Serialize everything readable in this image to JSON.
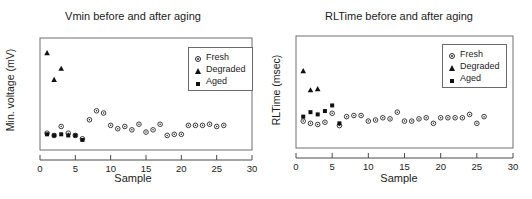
{
  "figure": {
    "panels": [
      {
        "id": "vmin-panel",
        "title": "Vmin before and after aging",
        "ylabel": "Min. voltage (mV)",
        "xlabel": "Sample",
        "legend": {
          "items": [
            {
              "label": "Fresh",
              "marker": "open-circle"
            },
            {
              "label": "Degraded",
              "marker": "filled-triangle"
            },
            {
              "label": "Aged",
              "marker": "filled-square"
            }
          ]
        },
        "xticks": [
          "0",
          "5",
          "10",
          "15",
          "20",
          "25",
          "30"
        ]
      },
      {
        "id": "rltime-panel",
        "title": "RLTime before and after aging",
        "ylabel": "RLTime (msec)",
        "xlabel": "Sample",
        "legend": {
          "items": [
            {
              "label": "Fresh",
              "marker": "open-circle"
            },
            {
              "label": "Degraded",
              "marker": "filled-triangle"
            },
            {
              "label": "Aged",
              "marker": "filled-square"
            }
          ]
        },
        "xticks": [
          "0",
          "5",
          "10",
          "15",
          "20",
          "25",
          "30"
        ]
      }
    ]
  },
  "chart_data": [
    {
      "type": "scatter",
      "title": "Vmin before and after aging",
      "xlabel": "Sample",
      "ylabel": "Min. voltage (mV)",
      "xlim": [
        0,
        30
      ],
      "ylim": [
        0,
        100
      ],
      "xticks": [
        0,
        5,
        10,
        15,
        20,
        25,
        30
      ],
      "yticks": [],
      "grid": false,
      "legend_position": "top-right",
      "series": [
        {
          "name": "Fresh",
          "marker": "open-circle",
          "points": [
            {
              "x": 1,
              "y": 15
            },
            {
              "x": 2,
              "y": 13
            },
            {
              "x": 3,
              "y": 21
            },
            {
              "x": 4,
              "y": 15
            },
            {
              "x": 5,
              "y": 13
            },
            {
              "x": 6,
              "y": 10
            },
            {
              "x": 7,
              "y": 27
            },
            {
              "x": 8,
              "y": 35
            },
            {
              "x": 9,
              "y": 33
            },
            {
              "x": 10,
              "y": 22
            },
            {
              "x": 11,
              "y": 19
            },
            {
              "x": 12,
              "y": 21
            },
            {
              "x": 13,
              "y": 18
            },
            {
              "x": 14,
              "y": 23
            },
            {
              "x": 15,
              "y": 16
            },
            {
              "x": 16,
              "y": 18
            },
            {
              "x": 17,
              "y": 23
            },
            {
              "x": 18,
              "y": 13
            },
            {
              "x": 19,
              "y": 14
            },
            {
              "x": 20,
              "y": 14
            },
            {
              "x": 21,
              "y": 22
            },
            {
              "x": 22,
              "y": 22
            },
            {
              "x": 23,
              "y": 22
            },
            {
              "x": 24,
              "y": 23
            },
            {
              "x": 25,
              "y": 21
            },
            {
              "x": 26,
              "y": 22
            }
          ]
        },
        {
          "name": "Degraded",
          "marker": "filled-triangle",
          "points": [
            {
              "x": 1,
              "y": 87
            },
            {
              "x": 2,
              "y": 63
            },
            {
              "x": 3,
              "y": 73
            }
          ]
        },
        {
          "name": "Aged",
          "marker": "filled-square",
          "points": [
            {
              "x": 1,
              "y": 14
            },
            {
              "x": 2,
              "y": 13
            },
            {
              "x": 3,
              "y": 14
            },
            {
              "x": 4,
              "y": 13
            },
            {
              "x": 5,
              "y": 13
            },
            {
              "x": 6,
              "y": 9
            }
          ]
        }
      ]
    },
    {
      "type": "scatter",
      "title": "RLTime before and after aging",
      "xlabel": "Sample",
      "ylabel": "RLTime (msec)",
      "xlim": [
        0,
        30
      ],
      "ylim": [
        0,
        100
      ],
      "xticks": [
        0,
        5,
        10,
        15,
        20,
        25,
        30
      ],
      "yticks": [],
      "grid": false,
      "legend_position": "top-right",
      "series": [
        {
          "name": "Fresh",
          "marker": "open-circle",
          "points": [
            {
              "x": 1,
              "y": 24
            },
            {
              "x": 2,
              "y": 22
            },
            {
              "x": 3,
              "y": 21
            },
            {
              "x": 4,
              "y": 23
            },
            {
              "x": 5,
              "y": 31
            },
            {
              "x": 6,
              "y": 20
            },
            {
              "x": 7,
              "y": 28
            },
            {
              "x": 8,
              "y": 29
            },
            {
              "x": 9,
              "y": 29
            },
            {
              "x": 10,
              "y": 24
            },
            {
              "x": 11,
              "y": 25
            },
            {
              "x": 12,
              "y": 27
            },
            {
              "x": 13,
              "y": 26
            },
            {
              "x": 14,
              "y": 32
            },
            {
              "x": 15,
              "y": 24
            },
            {
              "x": 16,
              "y": 24
            },
            {
              "x": 17,
              "y": 26
            },
            {
              "x": 18,
              "y": 27
            },
            {
              "x": 19,
              "y": 22
            },
            {
              "x": 20,
              "y": 27
            },
            {
              "x": 21,
              "y": 27
            },
            {
              "x": 22,
              "y": 27
            },
            {
              "x": 23,
              "y": 27
            },
            {
              "x": 24,
              "y": 30
            },
            {
              "x": 25,
              "y": 22
            },
            {
              "x": 26,
              "y": 28
            }
          ]
        },
        {
          "name": "Degraded",
          "marker": "filled-triangle",
          "points": [
            {
              "x": 1,
              "y": 69
            },
            {
              "x": 2,
              "y": 52
            },
            {
              "x": 3,
              "y": 53
            }
          ]
        },
        {
          "name": "Aged",
          "marker": "filled-square",
          "points": [
            {
              "x": 1,
              "y": 28
            },
            {
              "x": 2,
              "y": 32
            },
            {
              "x": 3,
              "y": 30
            },
            {
              "x": 4,
              "y": 33
            },
            {
              "x": 5,
              "y": 38
            },
            {
              "x": 6,
              "y": 22
            }
          ]
        }
      ]
    }
  ]
}
